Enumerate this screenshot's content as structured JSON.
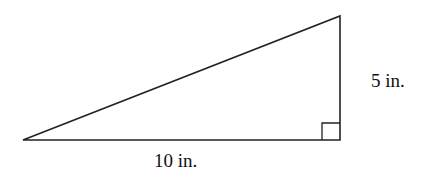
{
  "diagram": {
    "type": "right-triangle",
    "labels": {
      "height": "5 in.",
      "base": "10 in."
    },
    "stroke_color": "#222222",
    "right_angle_marker": true
  }
}
